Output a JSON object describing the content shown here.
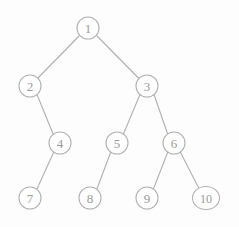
{
  "figure": {
    "kind": "binary-tree-diagram",
    "width": 239,
    "height": 227,
    "background_color": "#fdfdfd",
    "node_stroke_color": "#b2b2b2",
    "node_fill_color": "#ffffff",
    "edge_stroke_color": "#b0b0b0",
    "label_color": "#9a9a9a"
  },
  "nodes": [
    {
      "id": "1",
      "label": "1",
      "cx": 88,
      "cy": 28,
      "rx": 11,
      "ry": 11,
      "level": 0
    },
    {
      "id": "2",
      "label": "2",
      "cx": 30,
      "cy": 86,
      "rx": 11,
      "ry": 11,
      "level": 1
    },
    {
      "id": "3",
      "label": "3",
      "cx": 147,
      "cy": 86,
      "rx": 11,
      "ry": 11,
      "level": 1
    },
    {
      "id": "4",
      "label": "4",
      "cx": 60,
      "cy": 143,
      "rx": 11,
      "ry": 11,
      "level": 2
    },
    {
      "id": "5",
      "label": "5",
      "cx": 117,
      "cy": 143,
      "rx": 11,
      "ry": 11,
      "level": 2
    },
    {
      "id": "6",
      "label": "6",
      "cx": 174,
      "cy": 143,
      "rx": 11,
      "ry": 11,
      "level": 2
    },
    {
      "id": "7",
      "label": "7",
      "cx": 30,
      "cy": 198,
      "rx": 11,
      "ry": 11,
      "level": 3
    },
    {
      "id": "8",
      "label": "8",
      "cx": 90,
      "cy": 198,
      "rx": 11,
      "ry": 11,
      "level": 3
    },
    {
      "id": "9",
      "label": "9",
      "cx": 147,
      "cy": 198,
      "rx": 11,
      "ry": 11,
      "level": 3
    },
    {
      "id": "10",
      "label": "10",
      "cx": 206,
      "cy": 198,
      "rx": 13.5,
      "ry": 11.5,
      "level": 3
    }
  ],
  "edges": [
    {
      "id": "edge-1-2",
      "from": "1",
      "to": "2",
      "x1": 79.0,
      "y1": 36.0,
      "x2": 37.5,
      "y2": 78.5
    },
    {
      "id": "edge-1-3",
      "from": "1",
      "to": "3",
      "x1": 97.0,
      "y1": 36.0,
      "x2": 139.0,
      "y2": 78.5
    },
    {
      "id": "edge-2-4",
      "from": "2",
      "to": "4",
      "x1": 37.0,
      "y1": 94.5,
      "x2": 53.5,
      "y2": 135.0
    },
    {
      "id": "edge-3-5",
      "from": "3",
      "to": "5",
      "x1": 140.0,
      "y1": 94.5,
      "x2": 123.0,
      "y2": 135.0
    },
    {
      "id": "edge-3-6",
      "from": "3",
      "to": "6",
      "x1": 154.0,
      "y1": 94.5,
      "x2": 168.0,
      "y2": 135.0
    },
    {
      "id": "edge-4-7",
      "from": "4",
      "to": "7",
      "x1": 54.0,
      "y1": 151.5,
      "x2": 36.5,
      "y2": 190.0
    },
    {
      "id": "edge-5-8",
      "from": "5",
      "to": "8",
      "x1": 111.0,
      "y1": 151.5,
      "x2": 96.5,
      "y2": 190.0
    },
    {
      "id": "edge-6-9",
      "from": "6",
      "to": "9",
      "x1": 168.0,
      "y1": 151.5,
      "x2": 153.0,
      "y2": 190.0
    },
    {
      "id": "edge-6-10",
      "from": "6",
      "to": "10",
      "x1": 180.0,
      "y1": 151.5,
      "x2": 199.5,
      "y2": 189.5
    }
  ]
}
